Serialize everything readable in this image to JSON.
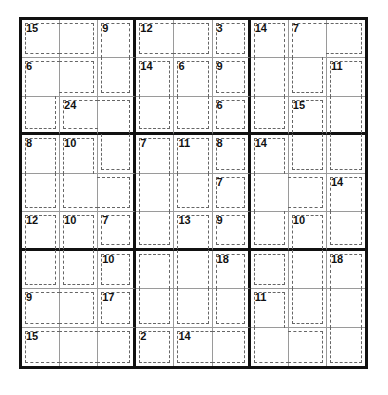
{
  "puzzle": {
    "type": "killer-sudoku",
    "size": 9,
    "cage_grid": [
      "aab|ccd|eff",
      "ggb|hij|efk",
      "gll|him|enk",
      "opl|qrs|tnk",
      "opp|qru|ttv",
      "wxy|qzA|tBv",
      "wxC|DzE|FBG",
      "HHI|DzE|JBG",
      "KKK|LMM|JJG"
    ],
    "cage_sums": {
      "a": "15",
      "b": "9",
      "c": "12",
      "d": "3",
      "e": "14",
      "f": "7",
      "g": "6",
      "h": "14",
      "i": "6",
      "j": "9",
      "k": "11",
      "l": "24",
      "m": "6",
      "n": "15",
      "o": "8",
      "p": "10",
      "q": "7",
      "r": "11",
      "s": "8",
      "t": "14",
      "u": "7",
      "v": "14",
      "w": "12",
      "x": "10",
      "y": "7",
      "z": "13",
      "A": "9",
      "B": "10",
      "C": "10",
      "D": "",
      "E": "18",
      "F": "",
      "G": "18",
      "H": "9",
      "I": "17",
      "J": "11",
      "K": "15",
      "L": "2",
      "M": "14"
    },
    "values": []
  }
}
